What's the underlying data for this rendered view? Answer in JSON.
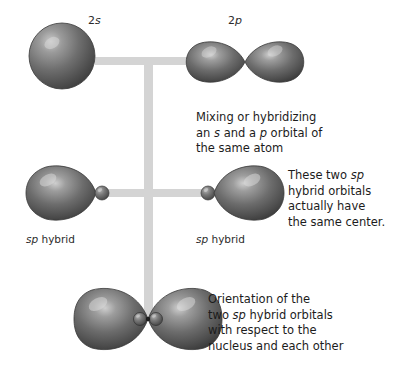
{
  "figure": {
    "background_color": "#ffffff",
    "connector_color": "#d4d4d4",
    "orbital_dark": "#5f5f5f",
    "orbital_mid": "#6e6e6e",
    "orbital_highlight": "#d8d8d8",
    "orbital_edge": "#3a3a3a"
  },
  "top_row": {
    "s_orbital_label_prefix": "2",
    "s_orbital_label_italic": "s",
    "p_orbital_label_prefix": "2",
    "p_orbital_label_italic": "p"
  },
  "middle_row": {
    "left_label_italic": "sp",
    "left_label_rest": " hybrid",
    "right_label_italic": "sp",
    "right_label_rest": " hybrid"
  },
  "callouts": {
    "mixing": {
      "line1_a": "Mixing or hybridizing",
      "line2_a": "an ",
      "line2_i": "s",
      "line2_b": " and a ",
      "line2_i2": "p",
      "line2_c": " orbital of",
      "line3_a": "the same atom"
    },
    "same_center": {
      "line1_a": "These two ",
      "line1_i": "sp",
      "line2_a": "hybrid orbitals",
      "line3_a": "actually have",
      "line4_a": "the same center."
    },
    "orientation": {
      "line1_a": "Orientation of the",
      "line2_a": "two ",
      "line2_i": "sp",
      "line2_b": " hybrid orbitals",
      "line3_a": "with respect to the",
      "line4_a": "nucleus and each other"
    }
  }
}
